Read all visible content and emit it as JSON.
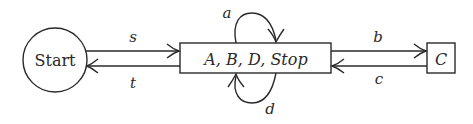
{
  "nodes": {
    "start": {
      "label": "Start",
      "shape": "circle"
    },
    "main": {
      "label": "A, B, D, Stop",
      "shape": "rect"
    },
    "c": {
      "label": "C",
      "shape": "rect"
    }
  },
  "edges": {
    "s": {
      "label": "s",
      "from": "Start",
      "to": "A, B, D, Stop"
    },
    "t": {
      "label": "t",
      "from": "A, B, D, Stop",
      "to": "Start"
    },
    "a": {
      "label": "a",
      "from": "A, B, D, Stop",
      "to": "A, B, D, Stop"
    },
    "d": {
      "label": "d",
      "from": "A, B, D, Stop",
      "to": "A, B, D, Stop"
    },
    "b": {
      "label": "b",
      "from": "A, B, D, Stop",
      "to": "C"
    },
    "c": {
      "label": "c",
      "from": "C",
      "to": "A, B, D, Stop"
    }
  }
}
